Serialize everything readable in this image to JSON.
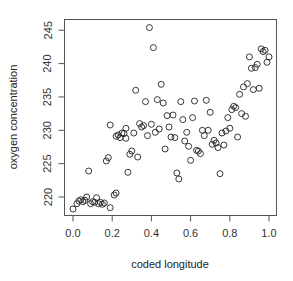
{
  "chart_data": {
    "type": "scatter",
    "title": "",
    "xlabel": "coded longitude",
    "ylabel": "oxygen concentration",
    "xlim": [
      -0.02,
      1.03
    ],
    "ylim": [
      217.5,
      247.2
    ],
    "x_ticks": [
      0.0,
      0.2,
      0.4,
      0.6,
      0.8,
      1.0
    ],
    "x_tick_labels": [
      "0.0",
      "0.2",
      "0.4",
      "0.6",
      "0.8",
      "1.0"
    ],
    "y_ticks": [
      220,
      225,
      230,
      235,
      240,
      245
    ],
    "y_tick_labels": [
      "220",
      "225",
      "230",
      "235",
      "240",
      "245"
    ],
    "grid": false,
    "legend": null,
    "marker": "open-circle",
    "points": [
      [
        0.0,
        218.2
      ],
      [
        0.02,
        219.0
      ],
      [
        0.03,
        219.4
      ],
      [
        0.04,
        219.6
      ],
      [
        0.05,
        219.3
      ],
      [
        0.06,
        219.5
      ],
      [
        0.07,
        220.0
      ],
      [
        0.08,
        223.9
      ],
      [
        0.09,
        219.0
      ],
      [
        0.1,
        219.3
      ],
      [
        0.11,
        219.2
      ],
      [
        0.12,
        219.9
      ],
      [
        0.13,
        219.0
      ],
      [
        0.14,
        219.2
      ],
      [
        0.15,
        218.9
      ],
      [
        0.16,
        219.1
      ],
      [
        0.17,
        225.4
      ],
      [
        0.18,
        225.9
      ],
      [
        0.19,
        230.8
      ],
      [
        0.19,
        218.4
      ],
      [
        0.21,
        220.3
      ],
      [
        0.22,
        220.6
      ],
      [
        0.22,
        229.1
      ],
      [
        0.23,
        229.3
      ],
      [
        0.24,
        228.9
      ],
      [
        0.25,
        229.6
      ],
      [
        0.26,
        229.5
      ],
      [
        0.27,
        228.8
      ],
      [
        0.27,
        230.3
      ],
      [
        0.28,
        223.7
      ],
      [
        0.29,
        226.4
      ],
      [
        0.3,
        226.9
      ],
      [
        0.31,
        229.6
      ],
      [
        0.32,
        236.0
      ],
      [
        0.33,
        226.0
      ],
      [
        0.34,
        231.0
      ],
      [
        0.35,
        230.5
      ],
      [
        0.36,
        230.7
      ],
      [
        0.37,
        234.3
      ],
      [
        0.38,
        229.2
      ],
      [
        0.39,
        245.4
      ],
      [
        0.4,
        230.9
      ],
      [
        0.41,
        242.4
      ],
      [
        0.42,
        229.7
      ],
      [
        0.43,
        234.6
      ],
      [
        0.44,
        230.2
      ],
      [
        0.45,
        236.9
      ],
      [
        0.46,
        234.1
      ],
      [
        0.47,
        227.2
      ],
      [
        0.48,
        232.2
      ],
      [
        0.49,
        230.5
      ],
      [
        0.5,
        229.0
      ],
      [
        0.51,
        232.3
      ],
      [
        0.52,
        228.9
      ],
      [
        0.53,
        223.6
      ],
      [
        0.54,
        222.7
      ],
      [
        0.55,
        234.3
      ],
      [
        0.56,
        231.6
      ],
      [
        0.57,
        228.4
      ],
      [
        0.58,
        229.7
      ],
      [
        0.59,
        227.6
      ],
      [
        0.6,
        225.5
      ],
      [
        0.61,
        231.9
      ],
      [
        0.62,
        234.4
      ],
      [
        0.63,
        227.0
      ],
      [
        0.64,
        226.9
      ],
      [
        0.65,
        226.5
      ],
      [
        0.66,
        230.0
      ],
      [
        0.67,
        229.2
      ],
      [
        0.68,
        234.5
      ],
      [
        0.69,
        230.0
      ],
      [
        0.7,
        232.7
      ],
      [
        0.71,
        227.9
      ],
      [
        0.72,
        228.5
      ],
      [
        0.73,
        228.1
      ],
      [
        0.74,
        227.4
      ],
      [
        0.75,
        223.5
      ],
      [
        0.76,
        229.6
      ],
      [
        0.77,
        227.8
      ],
      [
        0.78,
        229.9
      ],
      [
        0.79,
        231.9
      ],
      [
        0.8,
        230.3
      ],
      [
        0.81,
        233.1
      ],
      [
        0.82,
        233.6
      ],
      [
        0.83,
        233.4
      ],
      [
        0.84,
        229.0
      ],
      [
        0.85,
        235.4
      ],
      [
        0.86,
        232.5
      ],
      [
        0.87,
        236.5
      ],
      [
        0.88,
        232.1
      ],
      [
        0.89,
        237.0
      ],
      [
        0.9,
        241.0
      ],
      [
        0.91,
        239.3
      ],
      [
        0.92,
        236.1
      ],
      [
        0.93,
        239.4
      ],
      [
        0.94,
        239.9
      ],
      [
        0.95,
        236.3
      ],
      [
        0.96,
        242.2
      ],
      [
        0.97,
        241.8
      ],
      [
        0.98,
        242.0
      ],
      [
        0.99,
        240.2
      ],
      [
        1.0,
        241.0
      ]
    ]
  },
  "plot": {
    "x_axis_title": "coded longitude",
    "y_axis_title": "oxygen concentration"
  }
}
